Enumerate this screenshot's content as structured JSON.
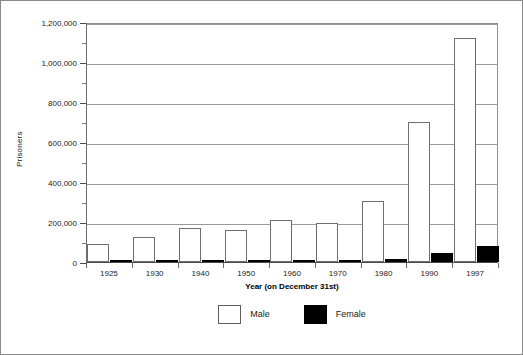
{
  "chart_data": {
    "type": "bar",
    "title": "",
    "xlabel": "Year  (on December 31st)",
    "ylabel": "Prisoners",
    "categories": [
      "1925",
      "1930",
      "1940",
      "1950",
      "1960",
      "1970",
      "1980",
      "1990",
      "1997"
    ],
    "series": [
      {
        "name": "Male",
        "color": "#ffffff",
        "values": [
          88000,
          126000,
          168000,
          160000,
          208000,
          196000,
          305000,
          700000,
          1122000
        ]
      },
      {
        "name": "Female",
        "color": "#000000",
        "values": [
          5000,
          6000,
          8000,
          8000,
          11000,
          6000,
          14000,
          44000,
          79000
        ]
      }
    ],
    "ylim": [
      0,
      1200000
    ],
    "ytick_labels": [
      "0",
      "200,000",
      "400,000",
      "600,000",
      "800,000",
      "1,000,000",
      "1,200,000"
    ],
    "ytick_values": [
      0,
      200000,
      400000,
      600000,
      800000,
      1000000,
      1200000
    ],
    "yminor_values": [
      100000,
      300000,
      500000,
      700000,
      900000,
      1100000
    ],
    "grid": true,
    "legend_position": "bottom",
    "legend": [
      {
        "label": "Male",
        "swatch": "white-square"
      },
      {
        "label": "Female",
        "swatch": "black-square"
      }
    ]
  }
}
